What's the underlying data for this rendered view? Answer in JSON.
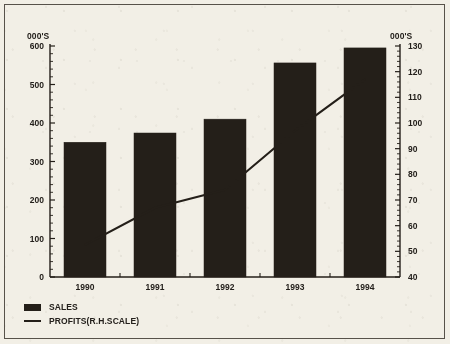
{
  "chart_data": {
    "type": "bar",
    "title": "",
    "subtitle": "",
    "categories": [
      "1990",
      "1991",
      "1992",
      "1993",
      "1994"
    ],
    "xlabel": "",
    "ylabel": "000'S",
    "y2label": "000'S",
    "ylim": [
      0,
      600
    ],
    "y2lim": [
      40,
      130
    ],
    "ytick_step": 100,
    "y2tick_step": 10,
    "yticks": [
      "0",
      "100",
      "200",
      "300",
      "400",
      "500",
      "600"
    ],
    "y2ticks": [
      "40",
      "50",
      "60",
      "70",
      "80",
      "90",
      "100",
      "110",
      "120",
      "130"
    ],
    "grid": false,
    "legend_position": "bottom-left",
    "series": [
      {
        "name": "SALES",
        "type": "bar",
        "axis": "left",
        "color": "#241f19",
        "values": [
          350,
          374,
          410,
          556,
          595
        ]
      },
      {
        "name": "PROFITS(R.H.SCALE)",
        "type": "line",
        "axis": "right",
        "color": "#241f19",
        "values": [
          52.5,
          67,
          74,
          97,
          117
        ]
      }
    ],
    "legend": [
      {
        "label": "SALES",
        "marker": "filled-rect"
      },
      {
        "label": "PROFITS(R.H.SCALE)",
        "marker": "line"
      }
    ]
  }
}
